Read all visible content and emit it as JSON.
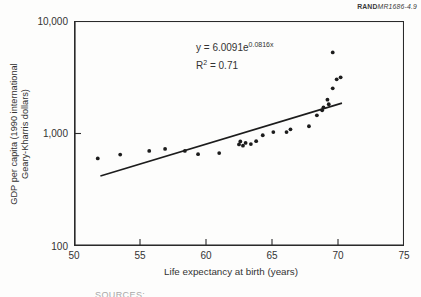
{
  "figure_label": {
    "brand": "RAND",
    "doc_ref": "MR1686-4.9"
  },
  "footer_partial": "SOURCES:",
  "chart_data": {
    "type": "scatter",
    "title": "",
    "xlabel": "Life expectancy at birth (years)",
    "ylabel_line1": "GDP per capita (1990 international",
    "ylabel_line2": "Geary-Kharris dollars)",
    "x_scale": "linear",
    "y_scale": "log",
    "xlim": [
      50,
      75
    ],
    "ylim": [
      100,
      10000
    ],
    "x_ticks": [
      50,
      55,
      60,
      65,
      70,
      75
    ],
    "y_ticks": [
      {
        "value": 100,
        "label": "100"
      },
      {
        "value": 1000,
        "label": "1,000"
      },
      {
        "value": 10000,
        "label": "10,000"
      }
    ],
    "grid": "off",
    "legend": "none",
    "annotation": {
      "eq_base": "y = 6.0091e",
      "eq_exp": "0.0816x",
      "r2_base": "R",
      "r2_sup": "2",
      "r2_rest": " = 0.71"
    },
    "trend": {
      "a": 6.0091,
      "b": 0.0816,
      "x_start": 52.0,
      "x_end": 70.3
    },
    "points": [
      [
        51.8,
        600
      ],
      [
        53.5,
        650
      ],
      [
        55.7,
        700
      ],
      [
        56.9,
        730
      ],
      [
        58.4,
        700
      ],
      [
        59.4,
        655
      ],
      [
        61.0,
        670
      ],
      [
        62.5,
        800
      ],
      [
        62.6,
        850
      ],
      [
        62.8,
        780
      ],
      [
        63.0,
        825
      ],
      [
        63.4,
        805
      ],
      [
        63.8,
        855
      ],
      [
        64.3,
        965
      ],
      [
        65.1,
        1030
      ],
      [
        66.1,
        1030
      ],
      [
        66.4,
        1090
      ],
      [
        67.8,
        1160
      ],
      [
        68.4,
        1450
      ],
      [
        68.8,
        1610
      ],
      [
        68.9,
        1710
      ],
      [
        69.2,
        2000
      ],
      [
        69.3,
        1820
      ],
      [
        69.6,
        2520
      ],
      [
        69.9,
        3030
      ],
      [
        70.2,
        3160
      ],
      [
        69.6,
        5260
      ]
    ],
    "point_color": "#1c1c1c",
    "line_color": "#1c1c1c",
    "axis_color": "#2a2a2a"
  }
}
